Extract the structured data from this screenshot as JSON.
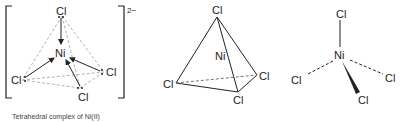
{
  "figure": {
    "panel_1": {
      "center_atom": "Ni",
      "ligands": [
        "Cl",
        "Cl",
        "Cl",
        "Cl"
      ],
      "charge": "2−",
      "caption": "Tetrahedral complex of Ni(II)",
      "description": "Lewis-style structure in square brackets; lone pairs shown as dots, coordinate bonds as arrows to Ni, tetrahedral edges dashed"
    },
    "panel_2": {
      "center_atom": "Ni",
      "ligands": [
        "Cl",
        "Cl",
        "Cl",
        "Cl"
      ],
      "description": "Tetrahedron drawing with Cl at vertices and Ni inside"
    },
    "panel_3": {
      "center_atom": "Ni",
      "ligands": [
        "Cl",
        "Cl",
        "Cl",
        "Cl"
      ],
      "description": "Wedge-dash 3D structure: one plain bond up, two dashed bonds, one wedge bond"
    },
    "colors": {
      "line": "#222222",
      "dashed_edge": "#aaaaaa"
    }
  }
}
